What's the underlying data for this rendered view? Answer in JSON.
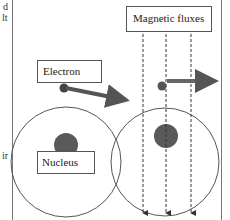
{
  "diagram": {
    "labels": {
      "electron": "Electron",
      "nucleus": "Nucleus",
      "magnetic_fluxes": "Magnetic fluxes"
    },
    "left_margin_fragments": [
      "d",
      "lt",
      "ir"
    ],
    "atoms": [
      {
        "name": "left-atom",
        "cx": 66,
        "cy": 162,
        "r": 55
      },
      {
        "name": "right-atom",
        "cx": 165,
        "cy": 162,
        "r": 54
      }
    ],
    "flux_lines_count": 3,
    "colors": {
      "line": "#555555",
      "nucleus": "#5a5a5a",
      "arrow": "#555555",
      "border": "#666666"
    }
  }
}
